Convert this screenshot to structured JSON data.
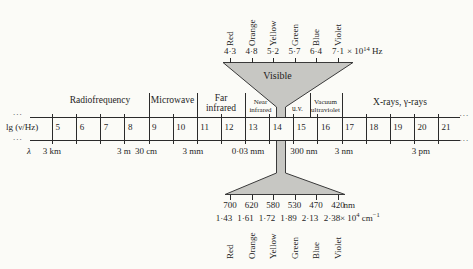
{
  "top_scale": {
    "color_labels": [
      "Red",
      "Orange",
      "Yellow",
      "Green",
      "Blue",
      "Violet"
    ],
    "frequencies": [
      "4·3",
      "4·8",
      "5·2",
      "5·7",
      "6·4",
      "7·1"
    ],
    "unit_prefix": "× 10",
    "unit_exponent": "14",
    "unit_suffix": " Hz",
    "funnel_label": "Visible"
  },
  "axis": {
    "label": "lg (ν/Hz)",
    "ticks": [
      "5",
      "6",
      "7",
      "8",
      "9",
      "10",
      "11",
      "12",
      "13",
      "14",
      "15",
      "16",
      "17",
      "18",
      "19",
      "20",
      "21"
    ],
    "ellipsis": "...",
    "regions": [
      {
        "lines": [
          "Radiofrequency"
        ]
      },
      {
        "lines": [
          "Microwave"
        ]
      },
      {
        "lines": [
          "Far",
          "infrared"
        ]
      },
      {
        "lines": [
          "Near",
          "infrared"
        ]
      },
      {
        "lines": [
          "u.v."
        ]
      },
      {
        "lines": [
          "Vacuum",
          "ultraviolet"
        ]
      },
      {
        "lines": [
          "X-rays, γ-rays"
        ]
      }
    ]
  },
  "wavelength_scale": {
    "symbol": "λ",
    "labels": [
      "3 km",
      "3 m",
      "30 cm",
      "3 mm",
      "0·03 mm",
      "300 nm",
      "3 nm",
      "3 pm"
    ]
  },
  "bottom_scale": {
    "wavelengths": [
      "700",
      "620",
      "580",
      "530",
      "470",
      "420"
    ],
    "wavelength_unit": "nm",
    "wavenumbers": [
      "1·43",
      "1·61",
      "1·72",
      "1·89",
      "2·13",
      "2·38"
    ],
    "wavenumber_unit_prefix": "× 10",
    "wavenumber_unit_exponent": "4",
    "wavenumber_unit_mid": " cm",
    "wavenumber_unit_exp2": "−1",
    "color_labels": [
      "Red",
      "Orange",
      "Yellow",
      "Green",
      "Blue",
      "Violet"
    ]
  },
  "colors": {
    "funnel_fill": "#c7c7c3",
    "line": "#3a3a3a",
    "background": "#fbfbf7"
  }
}
